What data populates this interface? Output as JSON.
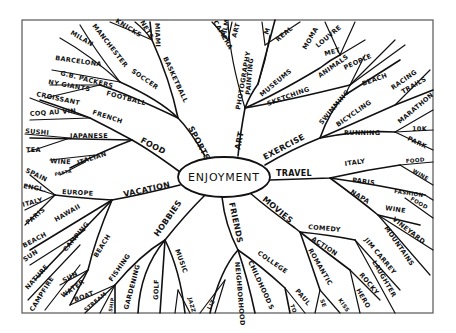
{
  "center": {
    "label": "ENJOYMENT"
  },
  "branches": {
    "sports": {
      "label": "SPORTS",
      "children": {
        "soccer": "SOCCER",
        "football": "FOOTBALL",
        "basketball": "BASKETBALL",
        "manchester": "MANCHESTER",
        "milan": "MILAN",
        "barcelona": "BARCELONA",
        "gb_packers": "G.B. PACKERS",
        "ny_giants": "NY GIANTS",
        "knicks": "KNICKS",
        "nets": "NETS",
        "miami": "MIAMI"
      }
    },
    "art": {
      "label": "ART",
      "children": {
        "photography": "PHOTOGRAPHY",
        "painting": "PAINTING",
        "museums": "MUSEUMS",
        "sketching": "SKETCHING",
        "camera": "CAMERA",
        "film": "FILM",
        "art_sub": "ART",
        "m": "M",
        "real": "REAL",
        "moma": "MOMA",
        "louvre": "LOUVRE",
        "met": "MET",
        "animals": "ANIMALS",
        "people": "PEOPLE"
      }
    },
    "exercise": {
      "label": "EXERCISE",
      "children": {
        "swimming": "SWIMMING",
        "beach": "BEACH",
        "bicycling": "BICYCLING",
        "racing": "RACING",
        "trails": "TRAILS",
        "running": "RUNNING",
        "marathon": "MARATHON",
        "10k": "10K",
        "park": "PARK"
      }
    },
    "travel": {
      "label": "TRAVEL",
      "children": {
        "italy": "ITALY",
        "food1": "FOOD",
        "wine1": "WINE",
        "paris": "PARIS",
        "fashion": "FASHION",
        "food2": "FOOD",
        "napa": "NAPA",
        "wine2": "WINE",
        "vineyard": "VINEYARD",
        "mountains": "MOUNTAINS"
      }
    },
    "movies": {
      "label": "MOVIES",
      "children": {
        "comedy": "COMEDY",
        "jim_carrey": "JIM CARREY",
        "laughter": "LAUGHTER",
        "action": "ACTION",
        "rocky": "ROCKY",
        "hero": "HERO",
        "romantic": "ROMANTIC",
        "se": "SE",
        "kiss": "KISS"
      }
    },
    "friends": {
      "label": "FRIENDS",
      "children": {
        "college": "COLLEGE",
        "paul": "PAUL",
        "to": "TO",
        "childhood": "CHILDHOOD",
        "s": "S",
        "neighborhood": "NEIGHBORHOOD",
        "liz": "LIZ"
      }
    },
    "hobbies": {
      "label": "HOBBIES",
      "children": {
        "music": "MUSIC",
        "jazz": "JAZZ",
        "golf": "GOLF",
        "gardening": "GARDENING",
        "fishing": "FISHING",
        "boat": "BOAT",
        "stream": "STREAM",
        "ship": "SHIP"
      }
    },
    "vacation": {
      "label": "VACATION",
      "children": {
        "europe": "EUROPE",
        "spain": "SPAIN",
        "engl": "ENGL.",
        "italy": "ITALY",
        "paris": "PARIS",
        "hawaii": "HAWAII",
        "beach1": "BEACH",
        "sun1": "SUN",
        "camping": "CAMPING",
        "nature": "NATURE",
        "campfire": "CAMPFIRE",
        "beach2": "BEACH",
        "sun2": "SUN",
        "water": "WATER"
      }
    },
    "food": {
      "label": "FOOD",
      "children": {
        "french": "FRENCH",
        "croissant": "CROISSANT",
        "coq_au_vin": "COQ AU VIN",
        "japanese": "JAPANESE",
        "sushi": "SUSHI",
        "tea": "TEA",
        "italian": "ITALIAN",
        "wine": "WINE",
        "pasta": "PASTA"
      }
    }
  },
  "colors": {
    "ink": "#111111",
    "frame": "#555555",
    "paper": "#ffffff"
  }
}
